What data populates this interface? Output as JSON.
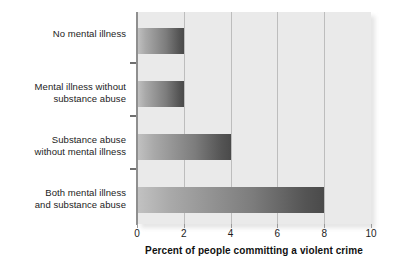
{
  "chart_data": {
    "type": "bar",
    "orientation": "horizontal",
    "title": "",
    "xlabel": "Percent of people committing a violent crime",
    "ylabel": "",
    "categories": [
      "No mental illness",
      "Mental illness without substance abuse",
      "Substance abuse without mental illness",
      "Both mental illness and substance abuse"
    ],
    "category_lines": [
      [
        "No mental illness"
      ],
      [
        "Mental illness without",
        "substance abuse"
      ],
      [
        "Substance abuse",
        "without mental illness"
      ],
      [
        "Both mental illness",
        "and substance abuse"
      ]
    ],
    "values": [
      2,
      2,
      4,
      8
    ],
    "xlim": [
      0,
      10
    ],
    "xticks": [
      0,
      2,
      4,
      6,
      8,
      10
    ],
    "xticklabels": [
      "0",
      "2",
      "4",
      "6",
      "8",
      "10"
    ],
    "grid": "vertical",
    "legend": null,
    "bar_gradient_from": "#c2c2c2",
    "bar_gradient_to": "#4a4a4a",
    "plot_background": "#eaeaea",
    "gridline_color": "#bdbdbd",
    "axis_color": "#8f8f8f",
    "text_color": "#1c1c1c"
  }
}
